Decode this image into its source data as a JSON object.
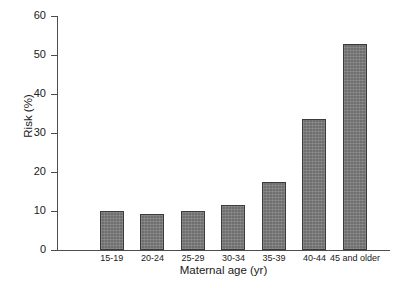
{
  "chart_data": {
    "type": "bar",
    "title": "",
    "xlabel": "Maternal age (yr)",
    "ylabel": "Risk (%)",
    "categories": [
      "15-19",
      "20-24",
      "25-29",
      "30-34",
      "35-39",
      "40-44",
      "45 and older"
    ],
    "values": [
      10.0,
      9.3,
      10.1,
      11.6,
      17.5,
      33.7,
      52.8
    ],
    "ylim": [
      0,
      60
    ],
    "yticks": [
      0,
      10,
      20,
      30,
      40,
      50,
      60
    ],
    "ytick_labels": [
      "0",
      "10",
      "20",
      "30",
      "40",
      "50",
      "60"
    ],
    "grid": false,
    "legend": null,
    "series_color": "#6f6f6f",
    "axis_color": "#4d4d4d",
    "background": "#ffffff"
  }
}
